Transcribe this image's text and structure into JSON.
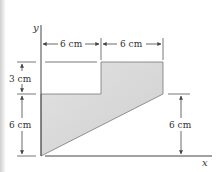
{
  "figure": {
    "axes": {
      "x_label": "x",
      "y_label": "y"
    },
    "shape": {
      "fill_color": "#d6d6d6",
      "fill_color_light": "#ececec",
      "outline_color": "#666666",
      "description": "Stepped region: left part 6 cm wide x 6 cm tall (bottom edge slanted), right part 6 cm wide rising 3 cm higher; slanted lower boundary from origin to (12, 6) cm"
    },
    "dimensions": {
      "top_left_width": "6 cm",
      "top_right_width": "6 cm",
      "left_upper_height": "3 cm",
      "left_lower_height": "6 cm",
      "right_height": "6 cm"
    },
    "colors": {
      "line": "#555555",
      "text": "#333333",
      "background": "#ffffff"
    }
  }
}
